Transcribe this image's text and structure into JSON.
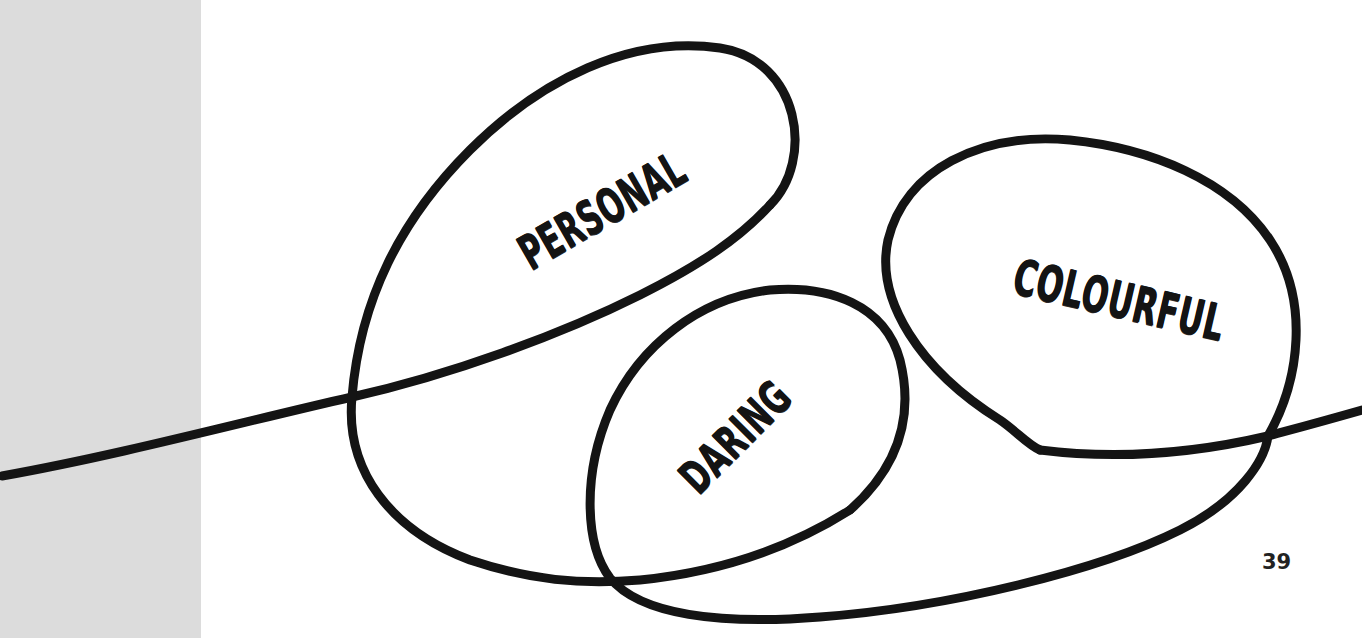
{
  "illustration": {
    "labels": {
      "personal": "PERSONAL",
      "daring": "DARING",
      "colourful": "COLOURFUL"
    },
    "line_color": "#141414",
    "page_background": "#ffffff",
    "gutter_color": "#dcdcdc"
  },
  "page": {
    "number": "39"
  }
}
